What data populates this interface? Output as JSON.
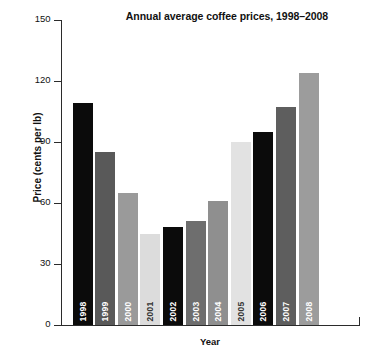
{
  "chart_data": {
    "type": "bar",
    "title": "Annual average coffee prices, 1998–2008",
    "xlabel": "Year",
    "ylabel": "Price (cents per lb)",
    "categories": [
      "1998",
      "1999",
      "2000",
      "2001",
      "2002",
      "2003",
      "2004",
      "2005",
      "2006",
      "2007",
      "2008"
    ],
    "values": [
      109,
      85,
      65,
      45,
      48,
      51,
      61,
      90,
      95,
      107,
      124
    ],
    "ylim": [
      0,
      150
    ],
    "yticks": [
      0,
      30,
      60,
      90,
      120,
      150
    ],
    "ytick_labels": [
      "0",
      "30",
      "60",
      "90",
      "120",
      "150"
    ],
    "grid": false,
    "legend": null,
    "bar_colors": [
      "#0b0b0b",
      "#595959",
      "#9a9a9a",
      "#dcdcdc",
      "#0b0b0b",
      "#6e6e6e",
      "#8f8f8f",
      "#e2e2e2",
      "#0b0b0b",
      "#5e5e5e",
      "#9c9c9c"
    ],
    "bar_label_colors": [
      "#ffffff",
      "#ffffff",
      "#ffffff",
      "#333333",
      "#ffffff",
      "#ffffff",
      "#ffffff",
      "#333333",
      "#ffffff",
      "#ffffff",
      "#ffffff"
    ],
    "bar_labels_inside": true,
    "bar_label_orientation": "vertical",
    "axis_color": "#2b2b2b",
    "background": "#ffffff"
  }
}
